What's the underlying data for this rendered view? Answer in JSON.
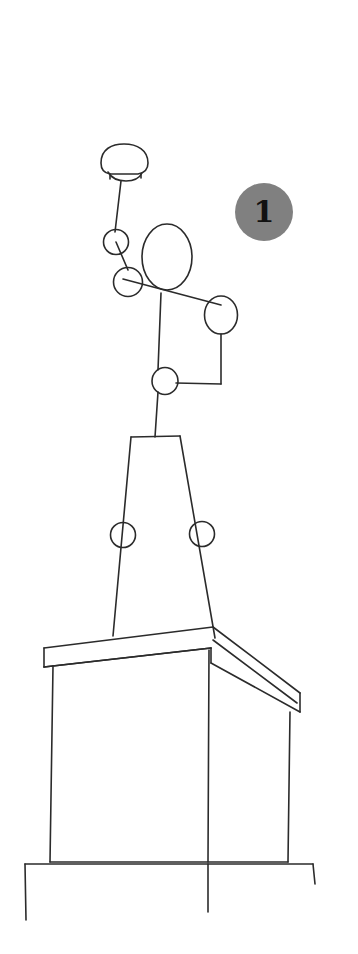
{
  "image": {
    "kind": "line-drawing",
    "title": "Hand-drawn sketch of a figure on a pedestal",
    "background_color": "#ffffff",
    "stroke_color": "#2b2b2b",
    "width": 358,
    "height": 954
  },
  "annotations": {
    "markers": [
      {
        "id": "marker-1",
        "label": "1",
        "shape": "circle",
        "fill_color": "#808080",
        "text_color": "#111111",
        "x": 235,
        "y": 183,
        "diameter": 58
      }
    ]
  },
  "drawing": {
    "parts": [
      {
        "name": "cap-dome",
        "type": "dome",
        "description": "Rounded cap / hat shape at top of figure"
      },
      {
        "name": "neck-line",
        "type": "line",
        "description": "Line connecting cap to upper small circle"
      },
      {
        "name": "upper-small-circle",
        "type": "circle",
        "description": "Small circle joint below cap"
      },
      {
        "name": "head-ellipse",
        "type": "ellipse",
        "description": "Large oval head"
      },
      {
        "name": "shoulder-circle",
        "type": "circle",
        "description": "Circle joint at shoulder"
      },
      {
        "name": "right-arm-circle",
        "type": "circle",
        "description": "Circle joint at right arm"
      },
      {
        "name": "waist-circle",
        "type": "circle",
        "description": "Circle joint at waist"
      },
      {
        "name": "arm-linkage",
        "type": "polyline",
        "description": "Lines linking shoulder, right arm and waist joints"
      },
      {
        "name": "trapezoid-body",
        "type": "trapezoid",
        "description": "Tapered body / plinth shaft"
      },
      {
        "name": "body-circle-left",
        "type": "circle",
        "description": "Circle on left edge of trapezoid body"
      },
      {
        "name": "body-circle-right",
        "type": "circle",
        "description": "Circle on right edge of trapezoid body"
      },
      {
        "name": "pedestal-cornice",
        "type": "prism",
        "description": "Three-dimensional cornice slab on top of pedestal"
      },
      {
        "name": "pedestal-body",
        "type": "box",
        "description": "Main pedestal block in perspective"
      },
      {
        "name": "pedestal-base",
        "type": "box",
        "description": "Wider base plinth at bottom"
      }
    ]
  }
}
